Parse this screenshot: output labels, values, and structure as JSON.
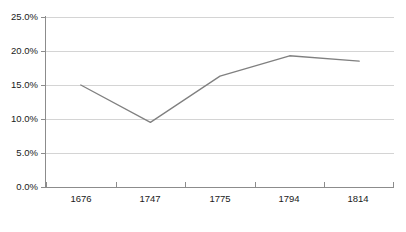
{
  "chart_data": {
    "type": "line",
    "title": "",
    "subtitle": "",
    "xlabel": "",
    "ylabel": "",
    "categories": [
      "1676",
      "1747",
      "1775",
      "1794",
      "1814"
    ],
    "series": [
      {
        "name": "",
        "values": [
          15.0,
          9.5,
          16.3,
          19.3,
          18.5
        ],
        "color": "#808080"
      }
    ],
    "ylim": [
      0,
      25
    ],
    "ytick_values": [
      0,
      5,
      10,
      15,
      20,
      25
    ],
    "ytick_labels": [
      "0.0%",
      "5.0%",
      "10.0%",
      "15.0%",
      "20.0%",
      "25.0%"
    ],
    "grid": {
      "horizontal": true,
      "vertical": false,
      "color": "#d4d4d4"
    },
    "legend": {
      "visible": false,
      "position": "none",
      "entries": []
    },
    "axis": {
      "line_color": "#8c8c8c",
      "x_tick_style": "between-categories",
      "y_tick_style": "at-value"
    },
    "markers": {
      "visible": false
    },
    "annotations": []
  }
}
